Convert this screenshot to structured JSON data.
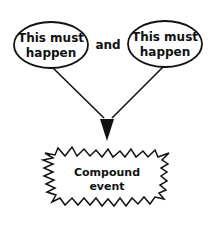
{
  "diagram": {
    "left_node": {
      "line1": "This must",
      "line2": "happen"
    },
    "connector": "and",
    "right_node": {
      "line1": "This must",
      "line2": "happen"
    },
    "result_node": {
      "line1": "Compound",
      "line2": "event"
    },
    "colors": {
      "stroke": "#111111",
      "background": "#ffffff"
    }
  }
}
